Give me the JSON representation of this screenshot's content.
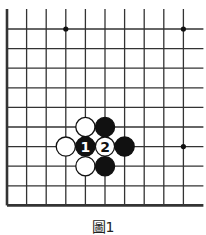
{
  "diagram": {
    "type": "go-board-fragment",
    "grid": {
      "origin_x": 7,
      "origin_y": 29,
      "spacing": 19.6,
      "cols": 10,
      "rows": 9,
      "top_extend": 20,
      "right_extend": 20,
      "left_edge_thick": true,
      "bottom_edge_thick": true,
      "line_color": "#333333"
    },
    "star_points": [
      {
        "col": 3,
        "row": 0
      },
      {
        "col": 9,
        "row": 0
      },
      {
        "col": 9,
        "row": 6
      }
    ],
    "stones": [
      {
        "color": "white",
        "col": 4,
        "row": 5,
        "label": ""
      },
      {
        "color": "black",
        "col": 5,
        "row": 5,
        "label": ""
      },
      {
        "color": "white",
        "col": 3,
        "row": 6,
        "label": ""
      },
      {
        "color": "black",
        "col": 4,
        "row": 6,
        "label": "1"
      },
      {
        "color": "white",
        "col": 5,
        "row": 6,
        "label": "2"
      },
      {
        "color": "black",
        "col": 6,
        "row": 6,
        "label": ""
      },
      {
        "color": "white",
        "col": 4,
        "row": 7,
        "label": ""
      },
      {
        "color": "black",
        "col": 5,
        "row": 7,
        "label": ""
      }
    ]
  },
  "caption": "圖1"
}
